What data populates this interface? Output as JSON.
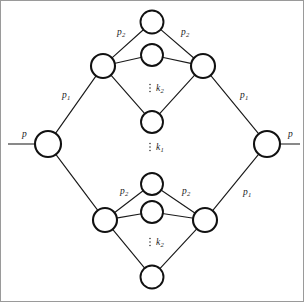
{
  "figure": {
    "type": "graph-diagram",
    "width": 304,
    "height": 302,
    "background_color": "#ffffff",
    "border_color": "#9a9a9a",
    "node_stroke_color": "#111111",
    "node_fill_color": "#ffffff",
    "edge_color": "#1a1a1a",
    "terminal_color": "#4a4a4a",
    "label_color": "#1a1a1a"
  },
  "nodes": [
    {
      "id": "left-terminal",
      "name": "left-terminal-node",
      "cx": 48,
      "cy": 144,
      "r": 13
    },
    {
      "id": "right-terminal",
      "name": "right-terminal-node",
      "cx": 267,
      "cy": 144,
      "r": 13
    },
    {
      "id": "u-top",
      "name": "upper-diamond-top-node",
      "cx": 152,
      "cy": 22,
      "r": 11.5
    },
    {
      "id": "u-left",
      "name": "upper-diamond-left-node",
      "cx": 103,
      "cy": 66,
      "r": 12
    },
    {
      "id": "u-right",
      "name": "upper-diamond-right-node",
      "cx": 203,
      "cy": 66,
      "r": 12
    },
    {
      "id": "u-mid",
      "name": "upper-diamond-middle-node",
      "cx": 152,
      "cy": 55,
      "r": 11
    },
    {
      "id": "u-bottom",
      "name": "upper-diamond-bottom-node",
      "cx": 152,
      "cy": 122,
      "r": 11
    },
    {
      "id": "l-top",
      "name": "lower-diamond-top-node",
      "cx": 152,
      "cy": 184,
      "r": 11
    },
    {
      "id": "l-left",
      "name": "lower-diamond-left-node",
      "cx": 105,
      "cy": 220,
      "r": 12
    },
    {
      "id": "l-right",
      "name": "lower-diamond-right-node",
      "cx": 205,
      "cy": 220,
      "r": 12
    },
    {
      "id": "l-mid",
      "name": "lower-diamond-middle-node",
      "cx": 152,
      "cy": 212,
      "r": 11
    },
    {
      "id": "l-bottom",
      "name": "lower-diamond-bottom-node",
      "cx": 152,
      "cy": 277,
      "r": 11.5
    }
  ],
  "edges": [
    {
      "name": "edge-left-terminal-to-upper-left",
      "from": "left-terminal",
      "to": "u-left"
    },
    {
      "name": "edge-left-terminal-to-lower-left",
      "from": "left-terminal",
      "to": "l-left"
    },
    {
      "name": "edge-upper-left-to-upper-top",
      "from": "u-left",
      "to": "u-top"
    },
    {
      "name": "edge-upper-top-to-upper-right",
      "from": "u-top",
      "to": "u-right"
    },
    {
      "name": "edge-upper-left-to-upper-mid",
      "from": "u-left",
      "to": "u-mid"
    },
    {
      "name": "edge-upper-mid-to-upper-right",
      "from": "u-mid",
      "to": "u-right"
    },
    {
      "name": "edge-upper-left-to-upper-bottom",
      "from": "u-left",
      "to": "u-bottom"
    },
    {
      "name": "edge-upper-bottom-to-upper-right",
      "from": "u-bottom",
      "to": "u-right"
    },
    {
      "name": "edge-upper-right-to-right-terminal",
      "from": "u-right",
      "to": "right-terminal"
    },
    {
      "name": "edge-lower-left-to-lower-top",
      "from": "l-left",
      "to": "l-top"
    },
    {
      "name": "edge-lower-top-to-lower-right",
      "from": "l-top",
      "to": "l-right"
    },
    {
      "name": "edge-lower-left-to-lower-mid",
      "from": "l-left",
      "to": "l-mid"
    },
    {
      "name": "edge-lower-mid-to-lower-right",
      "from": "l-mid",
      "to": "l-right"
    },
    {
      "name": "edge-lower-left-to-lower-bottom",
      "from": "l-left",
      "to": "l-bottom"
    },
    {
      "name": "edge-lower-bottom-to-lower-right",
      "from": "l-bottom",
      "to": "l-right"
    },
    {
      "name": "edge-lower-right-to-right-terminal",
      "from": "l-right",
      "to": "right-terminal"
    }
  ],
  "terminals": [
    {
      "name": "left-terminal-stub",
      "x1": 8,
      "y1": 144,
      "x2": 35,
      "y2": 144
    },
    {
      "name": "right-terminal-stub",
      "x1": 280,
      "y1": 144,
      "x2": 300,
      "y2": 144
    }
  ],
  "labels": {
    "p_left": {
      "text": "p",
      "sub": "",
      "x": 22,
      "y": 135
    },
    "p_right": {
      "text": "p",
      "sub": "",
      "x": 288,
      "y": 135
    },
    "p1_upper_left": {
      "text": "p",
      "sub": "1",
      "x": 62,
      "y": 96
    },
    "p1_upper_right": {
      "text": "p",
      "sub": "1",
      "x": 240,
      "y": 96
    },
    "p1_lower_right": {
      "text": "p",
      "sub": "1",
      "x": 243,
      "y": 193
    },
    "p2_upper_left": {
      "text": "p",
      "sub": "2",
      "x": 117,
      "y": 33
    },
    "p2_upper_right": {
      "text": "p",
      "sub": "2",
      "x": 181,
      "y": 33
    },
    "p2_lower_left": {
      "text": "p",
      "sub": "2",
      "x": 120,
      "y": 192
    },
    "p2_lower_right": {
      "text": "p",
      "sub": "2",
      "x": 182,
      "y": 192
    },
    "k2_upper": {
      "text": "k",
      "sub": "2",
      "x": 156,
      "y": 89
    },
    "k1_middle": {
      "text": "k",
      "sub": "1",
      "x": 156,
      "y": 148
    },
    "k2_lower": {
      "text": "k",
      "sub": "2",
      "x": 156,
      "y": 243
    }
  },
  "ellipses": [
    {
      "name": "vertical-ellipsis-upper",
      "x": 150,
      "y": 89
    },
    {
      "name": "vertical-ellipsis-middle",
      "x": 150,
      "y": 148
    },
    {
      "name": "vertical-ellipsis-lower",
      "x": 150,
      "y": 243
    }
  ]
}
